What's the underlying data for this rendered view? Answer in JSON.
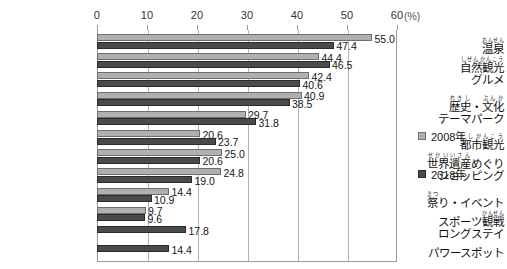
{
  "chart_data": {
    "type": "bar",
    "orientation": "horizontal",
    "title": "",
    "xlabel": "(%)",
    "ylabel": "",
    "xlim": [
      0,
      60
    ],
    "xticks": [
      0,
      10,
      20,
      30,
      40,
      50,
      60
    ],
    "xtick_labels": [
      "0",
      "10",
      "20",
      "30",
      "40",
      "50",
      "60"
    ],
    "grid": true,
    "legend_position": "right",
    "unit_label": "(%)",
    "categories": [
      "温泉",
      "自然観光",
      "グルメ",
      "歴史・文化",
      "テーマパーク",
      "都市観光",
      "世界遺産めぐり",
      "ショッピング",
      "祭り・イベント",
      "スポーツ観戦",
      "ロングステイ",
      "パワースポット"
    ],
    "category_ruby": [
      [
        {
          "base": "温泉",
          "rt": "おんせん"
        }
      ],
      [
        {
          "base": "自然観光",
          "rt": "しぜんかんこう"
        }
      ],
      [
        {
          "base": "グルメ",
          "rt": ""
        }
      ],
      [
        {
          "base": "歴史",
          "rt": "れきし"
        },
        {
          "base": "・",
          "rt": ""
        },
        {
          "base": "文化",
          "rt": "ぶんか"
        }
      ],
      [
        {
          "base": "テーマパーク",
          "rt": ""
        }
      ],
      [
        {
          "base": "都市観光",
          "rt": "としかんこう"
        }
      ],
      [
        {
          "base": "世界遺産",
          "rt": "せかいいさん"
        },
        {
          "base": "めぐり",
          "rt": ""
        }
      ],
      [
        {
          "base": "ショッピング",
          "rt": ""
        }
      ],
      [
        {
          "base": "祭",
          "rt": "まつ"
        },
        {
          "base": "り・イベント",
          "rt": ""
        }
      ],
      [
        {
          "base": "スポーツ",
          "rt": ""
        },
        {
          "base": "観戦",
          "rt": "かんせん"
        }
      ],
      [
        {
          "base": "ロングステイ",
          "rt": ""
        }
      ],
      [
        {
          "base": "パワースポット",
          "rt": ""
        }
      ]
    ],
    "series": [
      {
        "name": "2008年",
        "color": "#b0b0b0",
        "values": [
          55.0,
          44.4,
          42.4,
          40.9,
          29.7,
          20.6,
          25.0,
          24.8,
          14.4,
          9.7,
          null,
          null
        ]
      },
      {
        "name": "2018年",
        "color": "#4a4a4a",
        "values": [
          47.4,
          46.5,
          40.6,
          38.5,
          31.8,
          23.7,
          20.6,
          19.0,
          10.9,
          9.6,
          17.8,
          14.4
        ]
      }
    ],
    "value_labels": {
      "2008年": [
        "55.0",
        "44.4",
        "42.4",
        "40.9",
        "29.7",
        "20.6",
        "25.0",
        "24.8",
        "14.4",
        "9.7",
        "",
        ""
      ],
      "2018年": [
        "47.4",
        "46.5",
        "40.6",
        "38.5",
        "31.8",
        "23.7",
        "20.6",
        "19.0",
        "10.9",
        "9.6",
        "17.8",
        "14.4"
      ]
    }
  },
  "legend": {
    "items": [
      {
        "label": "2008年",
        "color": "#b0b0b0"
      },
      {
        "label": "2018年",
        "color": "#4a4a4a"
      }
    ]
  }
}
